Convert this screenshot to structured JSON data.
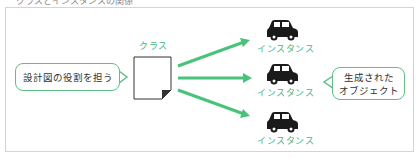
{
  "caption": {
    "text": "クラスとインスタンスの関係"
  },
  "diagram": {
    "left_bubble": {
      "text": "設計図の役割を担う"
    },
    "class": {
      "label": "クラス",
      "icon": "document-icon"
    },
    "arrows": {
      "count": 3,
      "color": "#49c27a"
    },
    "instances": [
      {
        "label": "インスタンス",
        "icon": "car-icon"
      },
      {
        "label": "インスタンス",
        "icon": "car-icon"
      },
      {
        "label": "インスタンス",
        "icon": "car-icon"
      }
    ],
    "right_bubble": {
      "line1": "生成された",
      "line2": "オブジェクト"
    },
    "colors": {
      "accent": "#49c27a",
      "label": "#49b47e",
      "frame": "#b9e3cf",
      "car": "#1a1a1a"
    }
  }
}
